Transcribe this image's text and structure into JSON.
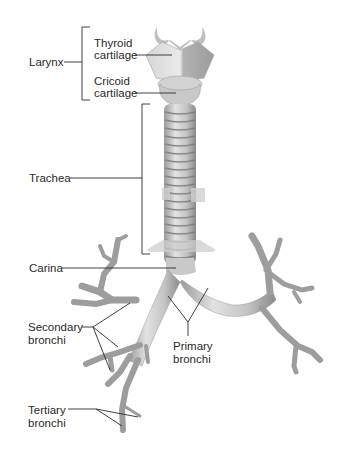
{
  "diagram": {
    "labels": {
      "larynx": "Larynx",
      "thyroid_line1": "Thyroid",
      "thyroid_line2": "cartilage",
      "cricoid_line1": "Cricoid",
      "cricoid_line2": "cartilage",
      "trachea": "Trachea",
      "carina": "Carina",
      "secondary_line1": "Secondary",
      "secondary_line2": "bronchi",
      "primary_line1": "Primary",
      "primary_line2": "bronchi",
      "tertiary_line1": "Tertiary",
      "tertiary_line2": "bronchi"
    },
    "colors": {
      "leader_line": "#2a2a2a",
      "structure_fill": "#c9c9c9",
      "structure_shadow": "#8c8c8c",
      "background": "#ffffff"
    }
  }
}
